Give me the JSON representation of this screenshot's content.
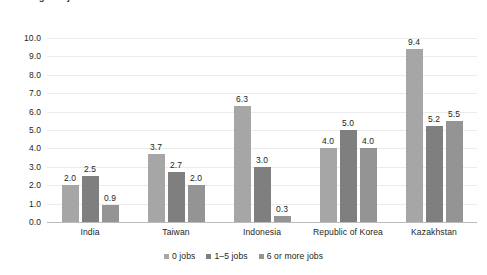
{
  "title": "Annual gross job creation",
  "chart_data": {
    "type": "bar",
    "title": "",
    "xlabel": "",
    "ylabel": "",
    "ylim": [
      0,
      10
    ],
    "ytick_step": 1,
    "grid": "horizontal",
    "legend_position": "bottom-center",
    "categories": [
      "India",
      "Taiwan",
      "Indonesia",
      "Republic of Korea",
      "Kazakhstan"
    ],
    "ytick_labels": [
      "0.0",
      "1.0",
      "2.0",
      "3.0",
      "4.0",
      "5.0",
      "6.0",
      "7.0",
      "8.0",
      "9.0",
      "10.0"
    ],
    "series": [
      {
        "name": "0 jobs",
        "color": "#a6a6a6",
        "values": [
          2.0,
          3.7,
          6.3,
          4.0,
          9.4
        ],
        "labels": [
          "2.0",
          "3.7",
          "6.3",
          "4.0",
          "9.4"
        ]
      },
      {
        "name": "1–5 jobs",
        "color": "#7f7f7f",
        "values": [
          2.5,
          2.7,
          3.0,
          5.0,
          5.2
        ],
        "labels": [
          "2.5",
          "2.7",
          "3.0",
          "5.0",
          "5.2"
        ]
      },
      {
        "name": "6 or more jobs",
        "color": "#949494",
        "values": [
          0.9,
          2.0,
          0.3,
          4.0,
          5.5
        ],
        "labels": [
          "0.9",
          "2.0",
          "0.3",
          "4.0",
          "5.5"
        ]
      }
    ]
  }
}
